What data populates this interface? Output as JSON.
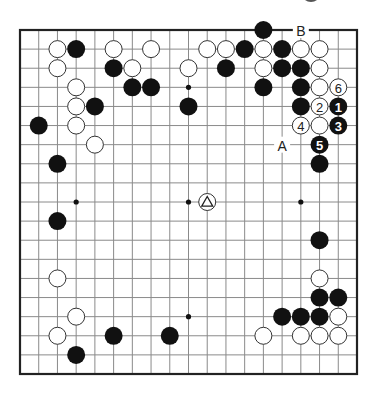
{
  "diagram": {
    "type": "go-board",
    "size": 19,
    "geometry": {
      "left": 20,
      "top": 30,
      "right": 357,
      "bottom": 374,
      "stone_radius": 9
    },
    "colors": {
      "black": "#111111",
      "white": "#ffffff",
      "grid": "#8a8a8a",
      "edge": "#222222"
    },
    "star_points": [
      [
        3,
        3
      ],
      [
        9,
        3
      ],
      [
        15,
        3
      ],
      [
        3,
        9
      ],
      [
        9,
        9
      ],
      [
        15,
        9
      ],
      [
        3,
        15
      ],
      [
        9,
        15
      ],
      [
        15,
        15
      ]
    ],
    "black_stones": [
      [
        13,
        0
      ],
      [
        3,
        1
      ],
      [
        12,
        1
      ],
      [
        14,
        1
      ],
      [
        5,
        2
      ],
      [
        11,
        2
      ],
      [
        14,
        2
      ],
      [
        15,
        2
      ],
      [
        6,
        3
      ],
      [
        7,
        3
      ],
      [
        13,
        3
      ],
      [
        15,
        3
      ],
      [
        4,
        4
      ],
      [
        9,
        4
      ],
      [
        15,
        4
      ],
      [
        1,
        5
      ],
      [
        2,
        7
      ],
      [
        16,
        7
      ],
      [
        2,
        10
      ],
      [
        16,
        11
      ],
      [
        16,
        14
      ],
      [
        17,
        14
      ],
      [
        14,
        15
      ],
      [
        15,
        15
      ],
      [
        16,
        15
      ],
      [
        5,
        16
      ],
      [
        8,
        16
      ],
      [
        3,
        17
      ]
    ],
    "white_stones": [
      [
        2,
        1
      ],
      [
        5,
        1
      ],
      [
        7,
        1
      ],
      [
        10,
        1
      ],
      [
        11,
        1
      ],
      [
        13,
        1
      ],
      [
        15,
        1
      ],
      [
        16,
        1
      ],
      [
        2,
        2
      ],
      [
        6,
        2
      ],
      [
        9,
        2
      ],
      [
        13,
        2
      ],
      [
        16,
        2
      ],
      [
        3,
        3
      ],
      [
        16,
        3
      ],
      [
        3,
        4
      ],
      [
        3,
        5
      ],
      [
        16,
        5
      ],
      [
        4,
        6
      ],
      [
        2,
        13
      ],
      [
        16,
        13
      ],
      [
        3,
        15
      ],
      [
        17,
        15
      ],
      [
        2,
        16
      ],
      [
        13,
        16
      ],
      [
        15,
        16
      ],
      [
        16,
        16
      ],
      [
        17,
        16
      ]
    ],
    "numbered_moves": [
      {
        "n": "1",
        "color": "black",
        "pos": [
          17,
          4
        ]
      },
      {
        "n": "2",
        "color": "white",
        "pos": [
          16,
          4
        ]
      },
      {
        "n": "3",
        "color": "black",
        "pos": [
          17,
          5
        ]
      },
      {
        "n": "4",
        "color": "white",
        "pos": [
          15,
          5
        ]
      },
      {
        "n": "5",
        "color": "black",
        "pos": [
          16,
          6
        ]
      },
      {
        "n": "6",
        "color": "white",
        "pos": [
          17,
          3
        ]
      }
    ],
    "marked_stones": [
      {
        "color": "white",
        "mark": "triangle",
        "pos": [
          10,
          9
        ]
      }
    ],
    "labels": [
      {
        "text": "A",
        "pos": [
          14,
          6
        ]
      },
      {
        "text": "B",
        "pos": [
          15,
          0
        ]
      }
    ]
  }
}
